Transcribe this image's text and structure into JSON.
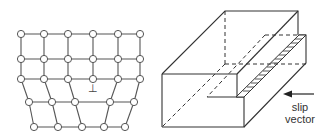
{
  "figure": {
    "left_panel": {
      "description": "Edge dislocation in a 2D crystal lattice",
      "rows": [
        {
          "y": 34,
          "x": [
            21,
            44,
            68,
            93,
            118,
            140
          ]
        },
        {
          "y": 59,
          "x": [
            21,
            44,
            68,
            93,
            118,
            140
          ]
        },
        {
          "y": 79,
          "x": [
            21,
            44,
            68,
            93,
            118,
            140
          ]
        },
        {
          "y": 102,
          "x": [
            29,
            52,
            75,
            110,
            134
          ]
        },
        {
          "y": 127,
          "x": [
            34,
            58,
            82,
            104,
            125
          ]
        }
      ],
      "dislocation_symbol": "⊥",
      "dislocation_position": {
        "x": 93,
        "y": 89
      }
    },
    "right_panel": {
      "description": "3D block with slip step showing edge dislocation",
      "arrow_direction": "left",
      "label_line1": "slip",
      "label_line2": "vector"
    }
  }
}
